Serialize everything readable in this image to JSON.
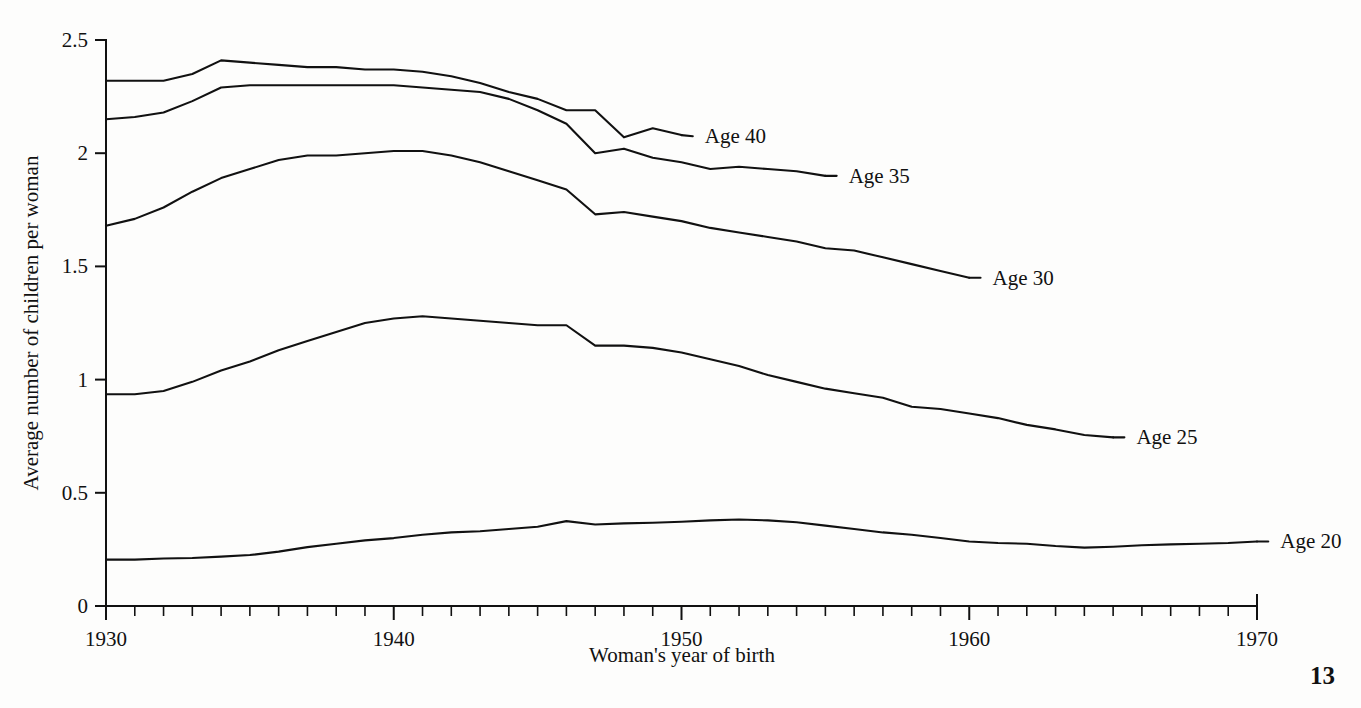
{
  "page": {
    "page_number": "13",
    "background_color": "#fdfdfc",
    "ink_color": "#111111"
  },
  "chart_data": {
    "type": "line",
    "title": "",
    "xlabel": "Woman's year of birth",
    "ylabel": "Average number of children per woman",
    "xlim": [
      1930,
      1970
    ],
    "ylim": [
      0,
      2.5
    ],
    "xticks": [
      1930,
      1940,
      1950,
      1960,
      1970
    ],
    "xtick_labels": [
      "1930",
      "1940",
      "1950",
      "1960",
      "1970"
    ],
    "xtick_minor_step": 1,
    "yticks": [
      0,
      0.5,
      1,
      1.5,
      2,
      2.5
    ],
    "ytick_labels": [
      "0",
      "0.5",
      "1",
      "1.5",
      "2",
      "2.5"
    ],
    "grid": false,
    "legend_position": "inline-right-of-line-end",
    "series": [
      {
        "name": "Age 40",
        "label": "Age 40",
        "color": "#111111",
        "label_x": 1950.6,
        "label_y": 2.075,
        "x": [
          1930,
          1931,
          1932,
          1933,
          1934,
          1935,
          1936,
          1937,
          1938,
          1939,
          1940,
          1941,
          1942,
          1943,
          1944,
          1945,
          1946,
          1947,
          1948,
          1949,
          1950
        ],
        "values": [
          2.32,
          2.32,
          2.32,
          2.35,
          2.41,
          2.4,
          2.39,
          2.38,
          2.38,
          2.37,
          2.37,
          2.36,
          2.34,
          2.31,
          2.27,
          2.24,
          2.19,
          2.19,
          2.07,
          2.11,
          2.08
        ]
      },
      {
        "name": "Age 35",
        "label": "Age 35",
        "color": "#111111",
        "label_x": 1955.6,
        "label_y": 1.9,
        "x": [
          1930,
          1931,
          1932,
          1933,
          1934,
          1935,
          1936,
          1937,
          1938,
          1939,
          1940,
          1941,
          1942,
          1943,
          1944,
          1945,
          1946,
          1947,
          1948,
          1949,
          1950,
          1951,
          1952,
          1953,
          1954,
          1955
        ],
        "values": [
          2.15,
          2.16,
          2.18,
          2.23,
          2.29,
          2.3,
          2.3,
          2.3,
          2.3,
          2.3,
          2.3,
          2.29,
          2.28,
          2.27,
          2.24,
          2.19,
          2.13,
          2.0,
          2.02,
          1.98,
          1.96,
          1.93,
          1.94,
          1.93,
          1.92,
          1.9
        ]
      },
      {
        "name": "Age 30",
        "label": "Age 30",
        "color": "#111111",
        "label_x": 1960.6,
        "label_y": 1.45,
        "x": [
          1930,
          1931,
          1932,
          1933,
          1934,
          1935,
          1936,
          1937,
          1938,
          1939,
          1940,
          1941,
          1942,
          1943,
          1944,
          1945,
          1946,
          1947,
          1948,
          1949,
          1950,
          1951,
          1952,
          1953,
          1954,
          1955,
          1956,
          1957,
          1958,
          1959,
          1960
        ],
        "values": [
          1.68,
          1.71,
          1.76,
          1.83,
          1.89,
          1.93,
          1.97,
          1.99,
          1.99,
          2.0,
          2.01,
          2.01,
          1.99,
          1.96,
          1.92,
          1.88,
          1.84,
          1.73,
          1.74,
          1.72,
          1.7,
          1.67,
          1.65,
          1.63,
          1.61,
          1.58,
          1.57,
          1.54,
          1.51,
          1.48,
          1.45
        ]
      },
      {
        "name": "Age 25",
        "label": "Age 25",
        "color": "#111111",
        "label_x": 1965.6,
        "label_y": 0.745,
        "x": [
          1930,
          1931,
          1932,
          1933,
          1934,
          1935,
          1936,
          1937,
          1938,
          1939,
          1940,
          1941,
          1942,
          1943,
          1944,
          1945,
          1946,
          1947,
          1948,
          1949,
          1950,
          1951,
          1952,
          1953,
          1954,
          1955,
          1956,
          1957,
          1958,
          1959,
          1960,
          1961,
          1962,
          1963,
          1964,
          1965
        ],
        "values": [
          0.935,
          0.935,
          0.95,
          0.99,
          1.04,
          1.08,
          1.13,
          1.17,
          1.21,
          1.25,
          1.27,
          1.28,
          1.27,
          1.26,
          1.25,
          1.24,
          1.24,
          1.15,
          1.15,
          1.14,
          1.12,
          1.09,
          1.06,
          1.02,
          0.99,
          0.96,
          0.94,
          0.92,
          0.88,
          0.87,
          0.85,
          0.83,
          0.8,
          0.78,
          0.755,
          0.745
        ]
      },
      {
        "name": "Age 20",
        "label": "Age 20",
        "color": "#111111",
        "label_x": 1970.6,
        "label_y": 0.285,
        "x": [
          1930,
          1931,
          1932,
          1933,
          1934,
          1935,
          1936,
          1937,
          1938,
          1939,
          1940,
          1941,
          1942,
          1943,
          1944,
          1945,
          1946,
          1947,
          1948,
          1949,
          1950,
          1951,
          1952,
          1953,
          1954,
          1955,
          1956,
          1957,
          1958,
          1959,
          1960,
          1961,
          1962,
          1963,
          1964,
          1965,
          1966,
          1967,
          1968,
          1969,
          1970
        ],
        "values": [
          0.205,
          0.205,
          0.21,
          0.212,
          0.218,
          0.225,
          0.24,
          0.26,
          0.275,
          0.29,
          0.3,
          0.315,
          0.325,
          0.33,
          0.34,
          0.35,
          0.375,
          0.36,
          0.365,
          0.368,
          0.372,
          0.378,
          0.382,
          0.378,
          0.37,
          0.355,
          0.34,
          0.325,
          0.315,
          0.3,
          0.285,
          0.278,
          0.275,
          0.265,
          0.258,
          0.262,
          0.268,
          0.272,
          0.275,
          0.278,
          0.285
        ]
      }
    ]
  }
}
